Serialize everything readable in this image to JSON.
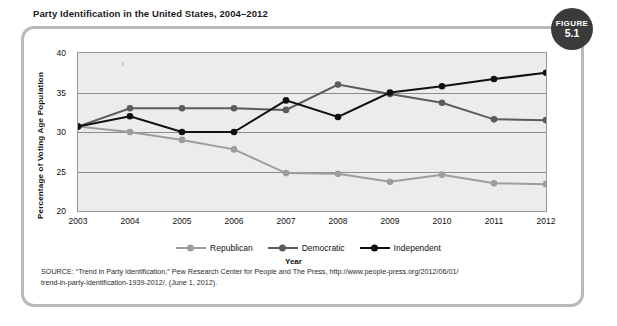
{
  "figure": {
    "title": "Party Identification in the United States, 2004–2012",
    "badge_word": "FIGURE",
    "badge_number": "5.1"
  },
  "source": {
    "line1": "SOURCE: “Trend in Party Identification,” Pew Research Center for People and The Press, http://www.people-press.org/2012/06/01/",
    "line2": "trend-in-party-identification-1939-2012/, (June 1, 2012)."
  },
  "colors": {
    "republican": "#9d9d9d",
    "democratic": "#5c5c5c",
    "independent": "#101010",
    "plot_background": "#ececec",
    "gridline": "#8d8d8d",
    "frame_border": "#b9b9b9",
    "badge_background": "#3b3b3b"
  },
  "chart_data": {
    "type": "line",
    "title": "Party Identification in the United States, 2004–2012",
    "xlabel": "Year",
    "ylabel": "Percentage of Voting Age Population",
    "x": [
      2003,
      2004,
      2005,
      2006,
      2007,
      2008,
      2009,
      2010,
      2011,
      2012
    ],
    "xtick_labels": [
      "2003",
      "2004",
      "2005",
      "2006",
      "2007",
      "2008",
      "2009",
      "2010",
      "2011",
      "2012"
    ],
    "ytick_labels": [
      "20",
      "25",
      "30",
      "35",
      "40"
    ],
    "yticks": [
      20,
      25,
      30,
      35,
      40
    ],
    "ylim": [
      20,
      40
    ],
    "xlim": [
      2003,
      2012
    ],
    "grid": true,
    "legend_position": "bottom",
    "series": [
      {
        "name": "Republican",
        "color": "#9d9d9d",
        "values": [
          30.7,
          30.0,
          29.0,
          27.8,
          24.8,
          24.7,
          23.7,
          24.6,
          23.5,
          23.4
        ]
      },
      {
        "name": "Democratic",
        "color": "#5c5c5c",
        "values": [
          30.7,
          33.0,
          33.0,
          33.0,
          32.8,
          36.0,
          34.8,
          33.7,
          31.6,
          31.5
        ]
      },
      {
        "name": "Independent",
        "color": "#101010",
        "values": [
          30.7,
          32.0,
          30.0,
          30.0,
          34.0,
          31.9,
          35.0,
          35.8,
          36.7,
          37.5
        ]
      }
    ]
  }
}
